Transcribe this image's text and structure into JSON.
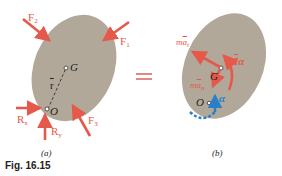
{
  "figure": {
    "caption": "Fig. 16.15",
    "colors": {
      "body_fill": "#b1a89a",
      "force_arrow": "#e5584a",
      "angular_accel_arrow": "#2a7fc9",
      "text": "#1e1e1e"
    },
    "panel_a": {
      "label": "(a)",
      "points": {
        "G": "G",
        "O": "O"
      },
      "position_vector": "r",
      "forces": [
        {
          "name": "F",
          "sub": "1"
        },
        {
          "name": "F",
          "sub": "2"
        },
        {
          "name": "F",
          "sub": "3"
        }
      ],
      "reactions": [
        {
          "name": "R",
          "sub": "x"
        },
        {
          "name": "R",
          "sub": "y"
        }
      ]
    },
    "equals_sign": "=",
    "panel_b": {
      "label": "(b)",
      "points": {
        "G": "G",
        "O": "O"
      },
      "inertia_tangential": {
        "prefix": "m",
        "vec": "a",
        "sub": "t"
      },
      "inertia_normal": {
        "prefix": "m",
        "vec": "a",
        "sub": "n"
      },
      "inertia_couple": {
        "prefix": "I",
        "sym": "α"
      },
      "angular_acceleration": "α"
    }
  }
}
